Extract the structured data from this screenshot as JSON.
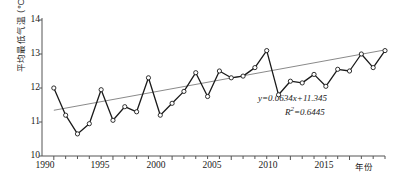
{
  "chart_data": {
    "type": "line",
    "title": "",
    "xlabel": "年份",
    "ylabel": "平均最低气温 (℃)",
    "xlim": [
      1989,
      2018
    ],
    "ylim": [
      10,
      14
    ],
    "yticks": [
      10,
      11,
      12,
      13,
      14
    ],
    "xticks": [
      1990,
      1995,
      2000,
      2005,
      2010,
      2015
    ],
    "grid": false,
    "legend": null,
    "marker": "open-circle",
    "x": [
      1990,
      1991,
      1992,
      1993,
      1994,
      1995,
      1996,
      1997,
      1998,
      1999,
      2000,
      2001,
      2002,
      2003,
      2004,
      2005,
      2006,
      2007,
      2008,
      2009,
      2010,
      2011,
      2012,
      2013,
      2014,
      2015,
      2016,
      2017,
      2018
    ],
    "values": [
      12.0,
      11.2,
      10.65,
      10.95,
      11.95,
      11.05,
      11.45,
      11.3,
      12.3,
      11.2,
      11.55,
      11.9,
      12.45,
      11.75,
      12.5,
      12.3,
      12.35,
      12.6,
      13.1,
      11.8,
      12.2,
      12.15,
      12.4,
      12.05,
      12.55,
      12.5,
      13.0,
      12.6,
      13.1
    ],
    "series": [
      {
        "name": "平均最低气温",
        "values": [
          12.0,
          11.2,
          10.65,
          10.95,
          11.95,
          11.05,
          11.45,
          11.3,
          12.3,
          11.2,
          11.55,
          11.9,
          12.45,
          11.75,
          12.5,
          12.3,
          12.35,
          12.6,
          13.1,
          11.8,
          12.2,
          12.15,
          12.4,
          12.05,
          12.55,
          12.5,
          13.0,
          12.6,
          13.1
        ]
      }
    ],
    "trendline": {
      "type": "linear",
      "slope": 0.0634,
      "intercept": 11.345,
      "r_squared": 0.6445,
      "equation_text": "y=0.0634x+11.345",
      "r_squared_text": "R2=0.6445",
      "x_start": 1990,
      "x_end": 2018,
      "y_start": 11.345,
      "y_end": 13.12
    },
    "annotations": [
      {
        "name": "regression-equation",
        "text": "y=0.0634x+11.345"
      },
      {
        "name": "r-squared",
        "text": "R2=0.6445"
      }
    ]
  },
  "axis": {
    "y_title": "平均最低气温 (℃)",
    "x_title": "年份",
    "y_tick_labels": [
      "14",
      "13",
      "12",
      "11",
      "10"
    ],
    "x_tick_labels": [
      "1990",
      "1995",
      "2000",
      "2005",
      "2010",
      "2015"
    ]
  },
  "equation": {
    "line1_pre": "y",
    "line1": "=0.0634x+11.345",
    "line2_pre": "R",
    "line2_sup": "2",
    "line2": "=0.6445"
  },
  "colors": {
    "series_line": "#1a1a1a",
    "marker_fill": "#ffffff",
    "marker_stroke": "#1a1a1a",
    "trend_line": "#8a8a8a",
    "axis": "#555555",
    "text": "#1a1a1a",
    "background": "#ffffff"
  }
}
